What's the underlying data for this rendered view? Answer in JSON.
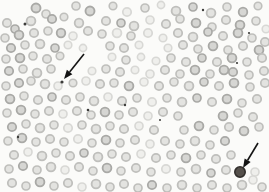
{
  "figure": {
    "type": "blood-smear-photomicrograph",
    "canvas": {
      "width": 269,
      "height": 192,
      "background": "#fbfbf9"
    },
    "palette": {
      "cell_shades": [
        {
          "fill": "#d6d6d3",
          "rim": "#a9a9a6"
        },
        {
          "fill": "#e3e3e0",
          "rim": "#bfbfbc"
        },
        {
          "fill": "#efefec",
          "rim": "#d8d8d5"
        }
      ],
      "speck_color": "#3c3c3a",
      "arrow_color": "#141414",
      "marked_cell_fill": "#55504b",
      "marked_cell_rim": "#322f2c"
    },
    "cells": [
      [
        36,
        8,
        4.5,
        0
      ],
      [
        46,
        14,
        4,
        1
      ],
      [
        76,
        6,
        4,
        1
      ],
      [
        90,
        11,
        4.5,
        0
      ],
      [
        113,
        6,
        3.8,
        1
      ],
      [
        127,
        12,
        4.2,
        2
      ],
      [
        145,
        8,
        4,
        1
      ],
      [
        161,
        5,
        3.6,
        2
      ],
      [
        176,
        11,
        4.4,
        1
      ],
      [
        193,
        7,
        4,
        0
      ],
      [
        211,
        13,
        4.4,
        1
      ],
      [
        227,
        7,
        4,
        1
      ],
      [
        243,
        12,
        4.3,
        0
      ],
      [
        258,
        6,
        3.8,
        1
      ],
      [
        7,
        23,
        4.2,
        1
      ],
      [
        15,
        29,
        4,
        0
      ],
      [
        31,
        21,
        4.4,
        1
      ],
      [
        52,
        19,
        4.2,
        0
      ],
      [
        64,
        17,
        3.8,
        1
      ],
      [
        79,
        23,
        4.3,
        1
      ],
      [
        106,
        21,
        4.2,
        1
      ],
      [
        121,
        23,
        4,
        0
      ],
      [
        134,
        26,
        4.4,
        1
      ],
      [
        150,
        20,
        4,
        2
      ],
      [
        166,
        24,
        4.2,
        1
      ],
      [
        180,
        19,
        4,
        1
      ],
      [
        196,
        23,
        4.4,
        0
      ],
      [
        212,
        27,
        4,
        1
      ],
      [
        226,
        20,
        4.2,
        1
      ],
      [
        240,
        25,
        4.4,
        0
      ],
      [
        256,
        21,
        4,
        1
      ],
      [
        266,
        29,
        3.8,
        2
      ],
      [
        5,
        38,
        4,
        1
      ],
      [
        19,
        35,
        4.4,
        0
      ],
      [
        34,
        33,
        4.2,
        1
      ],
      [
        48,
        31,
        4,
        1
      ],
      [
        61,
        33,
        4.3,
        0
      ],
      [
        73,
        36,
        4,
        2
      ],
      [
        88,
        31,
        4.2,
        1
      ],
      [
        102,
        34,
        4,
        1
      ],
      [
        117,
        33,
        4.4,
        2
      ],
      [
        131,
        36,
        4,
        1
      ],
      [
        148,
        33,
        4.2,
        2
      ],
      [
        163,
        38,
        3.8,
        2
      ],
      [
        178,
        33,
        4.2,
        1
      ],
      [
        193,
        37,
        4.4,
        1
      ],
      [
        208,
        32,
        4,
        0
      ],
      [
        223,
        36,
        4.2,
        1
      ],
      [
        238,
        33,
        4.4,
        0
      ],
      [
        252,
        38,
        4,
        1
      ],
      [
        265,
        42,
        4.2,
        1
      ],
      [
        11,
        48,
        4.2,
        0
      ],
      [
        25,
        45,
        4,
        1
      ],
      [
        40,
        44,
        4.4,
        1
      ],
      [
        55,
        48,
        4,
        0
      ],
      [
        68,
        45,
        3.8,
        2
      ],
      [
        83,
        48,
        3.6,
        2
      ],
      [
        110,
        46,
        4,
        1
      ],
      [
        124,
        48,
        4.2,
        1
      ],
      [
        139,
        45,
        3.8,
        2
      ],
      [
        168,
        48,
        3.8,
        2
      ],
      [
        183,
        45,
        4.2,
        1
      ],
      [
        198,
        49,
        4,
        1
      ],
      [
        213,
        46,
        4.4,
        0
      ],
      [
        228,
        50,
        4,
        1
      ],
      [
        243,
        46,
        4.2,
        1
      ],
      [
        259,
        50,
        4.4,
        0
      ],
      [
        6,
        59,
        4,
        1
      ],
      [
        20,
        58,
        4.4,
        0
      ],
      [
        33,
        56,
        4,
        1
      ],
      [
        47,
        59,
        4.2,
        1
      ],
      [
        60,
        56,
        3.8,
        1
      ],
      [
        112,
        57,
        3.8,
        2
      ],
      [
        126,
        60,
        4,
        1
      ],
      [
        141,
        57,
        3.6,
        2
      ],
      [
        156,
        61,
        3.8,
        2
      ],
      [
        171,
        58,
        4,
        1
      ],
      [
        186,
        62,
        4.2,
        1
      ],
      [
        202,
        58,
        4,
        0
      ],
      [
        217,
        62,
        4.2,
        1
      ],
      [
        232,
        58,
        4.4,
        0
      ],
      [
        247,
        62,
        4,
        1
      ],
      [
        262,
        58,
        4.2,
        1
      ],
      [
        9,
        71,
        4.2,
        0
      ],
      [
        23,
        69,
        4,
        1
      ],
      [
        37,
        73,
        4.4,
        1
      ],
      [
        51,
        69,
        4,
        1
      ],
      [
        92,
        71,
        3.8,
        2
      ],
      [
        106,
        69,
        4,
        1
      ],
      [
        120,
        72,
        4.2,
        1
      ],
      [
        135,
        70,
        3.8,
        2
      ],
      [
        150,
        74,
        4,
        2
      ],
      [
        165,
        70,
        4.2,
        1
      ],
      [
        180,
        74,
        4,
        1
      ],
      [
        195,
        70,
        4.4,
        0
      ],
      [
        210,
        74,
        4,
        1
      ],
      [
        224,
        70,
        4.4,
        0
      ],
      [
        233,
        72,
        4.2,
        0
      ],
      [
        249,
        75,
        4,
        1
      ],
      [
        264,
        71,
        4.2,
        1
      ],
      [
        6,
        86,
        4,
        1
      ],
      [
        19,
        83,
        4.2,
        0
      ],
      [
        31,
        81,
        4,
        1
      ],
      [
        45,
        84,
        4.4,
        1
      ],
      [
        58,
        86,
        4,
        2
      ],
      [
        73,
        83,
        3.8,
        1
      ],
      [
        86,
        81,
        4,
        2
      ],
      [
        100,
        84,
        4.2,
        1
      ],
      [
        114,
        83,
        4,
        1
      ],
      [
        129,
        86,
        4.4,
        0
      ],
      [
        144,
        82,
        4,
        2
      ],
      [
        159,
        86,
        4.2,
        1
      ],
      [
        174,
        82,
        4,
        1
      ],
      [
        189,
        86,
        4.4,
        1
      ],
      [
        204,
        82,
        4,
        0
      ],
      [
        219,
        86,
        4.2,
        1
      ],
      [
        234,
        83,
        4.4,
        0
      ],
      [
        250,
        87,
        4,
        1
      ],
      [
        265,
        83,
        4.2,
        1
      ],
      [
        10,
        99,
        4.4,
        0
      ],
      [
        24,
        96,
        4,
        1
      ],
      [
        38,
        100,
        4.2,
        1
      ],
      [
        52,
        97,
        4,
        0
      ],
      [
        66,
        100,
        4.2,
        1
      ],
      [
        80,
        97,
        4,
        1
      ],
      [
        94,
        101,
        4.4,
        1
      ],
      [
        108,
        97,
        4,
        2
      ],
      [
        122,
        101,
        4.2,
        1
      ],
      [
        137,
        98,
        4,
        1
      ],
      [
        152,
        102,
        4.2,
        2
      ],
      [
        167,
        98,
        4,
        1
      ],
      [
        182,
        102,
        4.4,
        1
      ],
      [
        197,
        98,
        4,
        0
      ],
      [
        212,
        102,
        4.2,
        1
      ],
      [
        227,
        99,
        4.4,
        0
      ],
      [
        242,
        103,
        4,
        1
      ],
      [
        257,
        99,
        4.2,
        1
      ],
      [
        7,
        113,
        4,
        1
      ],
      [
        21,
        110,
        4.4,
        0
      ],
      [
        35,
        114,
        4,
        1
      ],
      [
        49,
        111,
        4.2,
        1
      ],
      [
        63,
        114,
        4,
        2
      ],
      [
        77,
        111,
        4.2,
        1
      ],
      [
        91,
        115,
        4,
        1
      ],
      [
        105,
        112,
        4.4,
        0
      ],
      [
        119,
        115,
        4,
        1
      ],
      [
        133,
        112,
        4.2,
        1
      ],
      [
        148,
        116,
        4,
        2
      ],
      [
        163,
        112,
        4.2,
        1
      ],
      [
        178,
        116,
        4,
        1
      ],
      [
        223,
        116,
        4.4,
        0
      ],
      [
        238,
        113,
        4,
        1
      ],
      [
        253,
        117,
        4.2,
        1
      ],
      [
        12,
        127,
        4.2,
        0
      ],
      [
        26,
        124,
        4,
        1
      ],
      [
        40,
        128,
        4.4,
        1
      ],
      [
        54,
        125,
        4,
        1
      ],
      [
        68,
        128,
        4.2,
        2
      ],
      [
        82,
        125,
        4,
        1
      ],
      [
        96,
        129,
        4.4,
        1
      ],
      [
        110,
        126,
        4,
        1
      ],
      [
        124,
        129,
        4.2,
        1
      ],
      [
        139,
        126,
        4,
        2
      ],
      [
        154,
        130,
        4.2,
        1
      ],
      [
        184,
        130,
        4,
        1
      ],
      [
        199,
        126,
        4.4,
        0
      ],
      [
        214,
        130,
        4,
        1
      ],
      [
        229,
        127,
        4.2,
        1
      ],
      [
        244,
        131,
        4.4,
        0
      ],
      [
        259,
        127,
        4,
        1
      ],
      [
        8,
        141,
        4,
        1
      ],
      [
        22,
        138,
        4.4,
        0
      ],
      [
        36,
        142,
        4,
        1
      ],
      [
        50,
        139,
        4.2,
        1
      ],
      [
        64,
        142,
        4,
        1
      ],
      [
        78,
        139,
        4.2,
        2
      ],
      [
        92,
        143,
        4,
        1
      ],
      [
        106,
        140,
        4.4,
        0
      ],
      [
        120,
        143,
        4,
        1
      ],
      [
        135,
        140,
        4.2,
        1
      ],
      [
        150,
        144,
        4,
        2
      ],
      [
        165,
        141,
        4.2,
        1
      ],
      [
        180,
        144,
        4,
        1
      ],
      [
        195,
        141,
        4.4,
        1
      ],
      [
        210,
        145,
        4,
        1
      ],
      [
        225,
        141,
        4.2,
        0
      ],
      [
        14,
        155,
        4.2,
        1
      ],
      [
        28,
        152,
        4,
        2
      ],
      [
        42,
        156,
        4.4,
        1
      ],
      [
        56,
        153,
        4,
        1
      ],
      [
        70,
        156,
        4.2,
        1
      ],
      [
        84,
        153,
        4,
        0
      ],
      [
        98,
        157,
        4.4,
        1
      ],
      [
        112,
        154,
        4,
        1
      ],
      [
        126,
        157,
        4.2,
        1
      ],
      [
        141,
        154,
        4,
        2
      ],
      [
        156,
        158,
        4.2,
        1
      ],
      [
        171,
        155,
        4,
        1
      ],
      [
        186,
        158,
        4.4,
        0
      ],
      [
        201,
        155,
        4,
        1
      ],
      [
        216,
        159,
        4.2,
        1
      ],
      [
        231,
        155,
        4,
        1
      ],
      [
        9,
        169,
        4,
        1
      ],
      [
        23,
        166,
        4.2,
        0
      ],
      [
        37,
        170,
        4,
        1
      ],
      [
        51,
        167,
        4.4,
        1
      ],
      [
        65,
        170,
        4,
        2
      ],
      [
        79,
        167,
        4.2,
        1
      ],
      [
        93,
        171,
        4,
        1
      ],
      [
        107,
        168,
        4.4,
        0
      ],
      [
        121,
        171,
        4,
        1
      ],
      [
        136,
        168,
        4.2,
        1
      ],
      [
        151,
        172,
        4,
        1
      ],
      [
        166,
        169,
        4.2,
        2
      ],
      [
        181,
        172,
        4,
        1
      ],
      [
        196,
        169,
        4.4,
        1
      ],
      [
        211,
        173,
        4,
        0
      ],
      [
        226,
        170,
        4.2,
        1
      ],
      [
        255,
        172,
        4,
        2
      ],
      [
        12,
        183,
        4.2,
        1
      ],
      [
        26,
        186,
        4,
        1
      ],
      [
        40,
        182,
        4.4,
        0
      ],
      [
        54,
        186,
        4,
        1
      ],
      [
        68,
        183,
        4.2,
        1
      ],
      [
        82,
        187,
        4,
        2
      ],
      [
        96,
        184,
        4.4,
        1
      ],
      [
        110,
        187,
        4,
        1
      ],
      [
        124,
        184,
        4.2,
        1
      ],
      [
        138,
        188,
        4,
        1
      ],
      [
        152,
        185,
        4.2,
        0
      ],
      [
        167,
        188,
        4,
        1
      ],
      [
        182,
        185,
        4.4,
        1
      ],
      [
        197,
        188,
        4,
        1
      ],
      [
        212,
        185,
        4.2,
        1
      ],
      [
        227,
        188,
        4,
        1
      ],
      [
        242,
        185,
        4.4,
        1
      ],
      [
        253,
        180,
        4,
        2
      ],
      [
        262,
        187,
        4,
        1
      ]
    ],
    "specks": [
      [
        25,
        24,
        1.5
      ],
      [
        88,
        110,
        1.3
      ],
      [
        18,
        137,
        1.2
      ],
      [
        203,
        10,
        1.2
      ],
      [
        249,
        33,
        1.1
      ],
      [
        125,
        105,
        1.2
      ],
      [
        237,
        63,
        1.1
      ],
      [
        160,
        120,
        1.0
      ],
      [
        62,
        82,
        1.6
      ]
    ],
    "arrows": [
      {
        "tail_x": 84,
        "tail_y": 54,
        "tip_x": 64,
        "tip_y": 79
      },
      {
        "tail_x": 258,
        "tail_y": 143,
        "tip_x": 243,
        "tip_y": 168
      }
    ],
    "marked_cell": {
      "x": 240,
      "y": 172,
      "r": 5.2
    }
  }
}
